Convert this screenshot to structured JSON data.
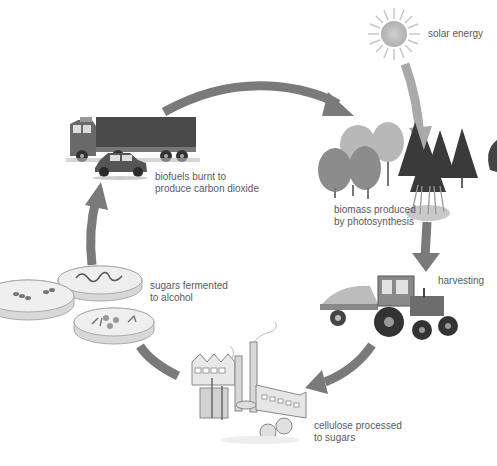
{
  "diagram": {
    "type": "cycle",
    "title": "",
    "colors": {
      "arrow": "#7a7a7a",
      "arrow_light": "#a9a9a9",
      "label": "#5a5a5a",
      "sun": "#bdbdbd",
      "background": "#ffffff"
    },
    "nodes": [
      {
        "id": "solar",
        "icon": "sun-icon",
        "label_lines": [
          "solar energy"
        ]
      },
      {
        "id": "biomass",
        "icon": "trees-icon",
        "label_lines": [
          "biomass produced",
          "by photosynthesis"
        ]
      },
      {
        "id": "harvest",
        "icon": "tractor-icon",
        "label_lines": [
          "harvesting"
        ]
      },
      {
        "id": "factory",
        "icon": "factory-icon",
        "label_lines": [
          "cellulose processed",
          "to sugars"
        ]
      },
      {
        "id": "ferment",
        "icon": "petri-dishes-icon",
        "label_lines": [
          "sugars fermented",
          "to alcohol"
        ]
      },
      {
        "id": "vehicles",
        "icon": "truck-car-icon",
        "label_lines": [
          "biofuels burnt to",
          "produce carbon dioxide"
        ]
      }
    ],
    "edges": [
      {
        "from": "solar",
        "to": "biomass"
      },
      {
        "from": "vehicles",
        "to": "biomass"
      },
      {
        "from": "biomass",
        "to": "harvest"
      },
      {
        "from": "harvest",
        "to": "factory"
      },
      {
        "from": "factory",
        "to": "ferment"
      },
      {
        "from": "ferment",
        "to": "vehicles"
      }
    ]
  }
}
